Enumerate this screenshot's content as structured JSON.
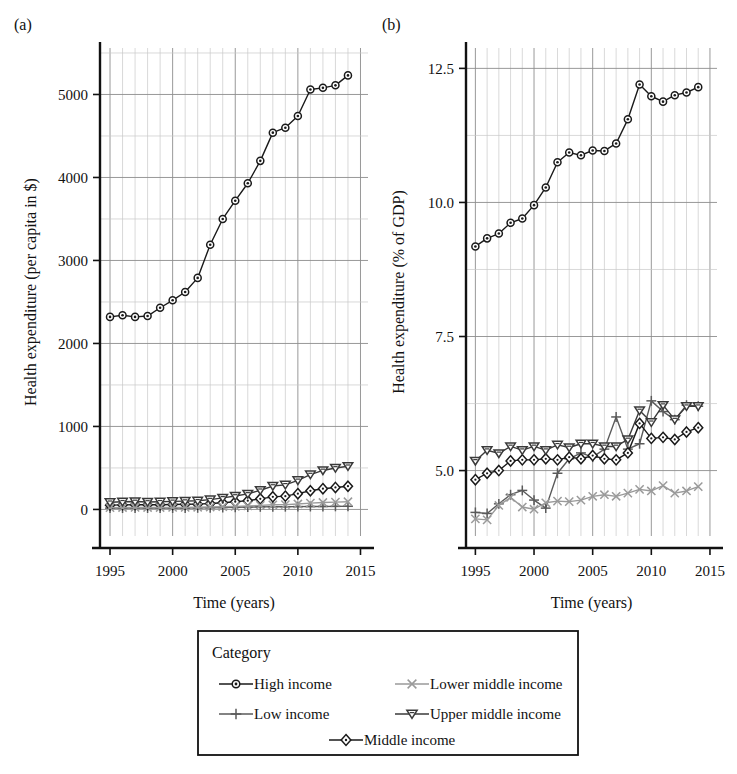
{
  "figure": {
    "panel_a_label": "(a)",
    "panel_b_label": "(b)",
    "xlabel": "Time (years)"
  },
  "legend": {
    "title": "Category",
    "box": true,
    "entries": [
      {
        "label": "High income",
        "marker": "circle",
        "color": "#1a1a1a"
      },
      {
        "label": "Lower middle income",
        "marker": "x",
        "color": "#9a9a9a"
      },
      {
        "label": "Low income",
        "marker": "plus",
        "color": "#5a5a5a"
      },
      {
        "label": "Upper middle income",
        "marker": "triangle-down",
        "color": "#3a3a3a"
      },
      {
        "label": "Middle income",
        "marker": "diamond",
        "color": "#1a1a1a"
      }
    ]
  },
  "chart_data": [
    {
      "type": "line",
      "panel": "(a)",
      "title": "",
      "xlabel": "Time (years)",
      "ylabel": "Health expenditure (per capita in $)",
      "xlim": [
        1994.2,
        2015.6
      ],
      "ylim": [
        -320,
        5560
      ],
      "xticks": [
        1995,
        2000,
        2005,
        2010,
        2015
      ],
      "yticks": [
        0,
        1000,
        2000,
        3000,
        4000,
        5000
      ],
      "xtick_labels": [
        "1995",
        "2000",
        "2005",
        "2010",
        "2015"
      ],
      "ytick_labels": [
        "0",
        "1000",
        "2000",
        "3000",
        "4000",
        "5000"
      ],
      "grid": true,
      "legend_position": "below-figure",
      "x": [
        1995,
        1996,
        1997,
        1998,
        1999,
        2000,
        2001,
        2002,
        2003,
        2004,
        2005,
        2006,
        2007,
        2008,
        2009,
        2010,
        2011,
        2012,
        2013,
        2014
      ],
      "series": [
        {
          "name": "High income",
          "marker": "circle",
          "color": "#1a1a1a",
          "values": [
            2320,
            2340,
            2320,
            2330,
            2430,
            2520,
            2620,
            2790,
            3190,
            3500,
            3720,
            3930,
            4200,
            4540,
            4600,
            4740,
            5060,
            5080,
            5110,
            5230
          ]
        },
        {
          "name": "Low income",
          "marker": "plus",
          "color": "#5a5a5a",
          "values": [
            16,
            16,
            17,
            17,
            17,
            17,
            18,
            19,
            21,
            23,
            26,
            28,
            31,
            33,
            33,
            34,
            35,
            36,
            37,
            38
          ]
        },
        {
          "name": "Middle income",
          "marker": "diamond",
          "color": "#1a1a1a",
          "values": [
            52,
            55,
            58,
            56,
            57,
            60,
            62,
            64,
            71,
            81,
            93,
            106,
            128,
            152,
            160,
            190,
            225,
            250,
            265,
            280
          ]
        },
        {
          "name": "Lower middle income",
          "marker": "x",
          "color": "#9a9a9a",
          "values": [
            22,
            23,
            24,
            23,
            23,
            24,
            25,
            26,
            29,
            33,
            37,
            42,
            49,
            56,
            58,
            66,
            76,
            84,
            88,
            93
          ]
        },
        {
          "name": "Upper middle income",
          "marker": "triangle-down",
          "color": "#3a3a3a",
          "values": [
            86,
            92,
            96,
            90,
            92,
            97,
            100,
            104,
            118,
            139,
            162,
            187,
            231,
            282,
            296,
            350,
            420,
            470,
            500,
            520
          ]
        }
      ]
    },
    {
      "type": "line",
      "panel": "(b)",
      "title": "",
      "xlabel": "Time (years)",
      "ylabel": "Health expenditure (% of GDP)",
      "xlim": [
        1994.2,
        2015.6
      ],
      "ylim": [
        3.78,
        12.88
      ],
      "xticks": [
        1995,
        2000,
        2005,
        2010,
        2015
      ],
      "yticks": [
        5.0,
        7.5,
        10.0,
        12.5
      ],
      "xtick_labels": [
        "1995",
        "2000",
        "2005",
        "2010",
        "2015"
      ],
      "ytick_labels": [
        "5.0",
        "7.5",
        "10.0",
        "12.5"
      ],
      "grid": true,
      "legend_position": "below-figure",
      "x": [
        1995,
        1996,
        1997,
        1998,
        1999,
        2000,
        2001,
        2002,
        2003,
        2004,
        2005,
        2006,
        2007,
        2008,
        2009,
        2010,
        2011,
        2012,
        2013,
        2014
      ],
      "series": [
        {
          "name": "High income",
          "marker": "circle",
          "color": "#1a1a1a",
          "values": [
            9.18,
            9.33,
            9.42,
            9.62,
            9.7,
            9.95,
            10.28,
            10.75,
            10.93,
            10.88,
            10.97,
            10.96,
            11.1,
            11.55,
            12.2,
            11.98,
            11.88,
            12.0,
            12.05,
            12.15
          ]
        },
        {
          "name": "Low income",
          "marker": "plus",
          "color": "#5a5a5a",
          "values": [
            4.22,
            4.2,
            4.38,
            4.55,
            4.63,
            4.45,
            4.3,
            4.95,
            5.22,
            5.33,
            5.25,
            5.4,
            6.0,
            5.4,
            5.5,
            6.3,
            6.1,
            5.95,
            6.22,
            6.2
          ]
        },
        {
          "name": "Middle income",
          "marker": "diamond",
          "color": "#1a1a1a",
          "values": [
            4.83,
            4.95,
            5.0,
            5.18,
            5.2,
            5.2,
            5.22,
            5.2,
            5.25,
            5.22,
            5.28,
            5.22,
            5.2,
            5.33,
            5.88,
            5.6,
            5.62,
            5.58,
            5.72,
            5.8
          ]
        },
        {
          "name": "Lower middle income",
          "marker": "x",
          "color": "#9a9a9a",
          "values": [
            4.1,
            4.08,
            4.35,
            4.5,
            4.32,
            4.28,
            4.4,
            4.43,
            4.42,
            4.45,
            4.52,
            4.55,
            4.52,
            4.58,
            4.65,
            4.62,
            4.72,
            4.58,
            4.62,
            4.7
          ]
        },
        {
          "name": "Upper middle income",
          "marker": "triangle-down",
          "color": "#3a3a3a",
          "values": [
            5.18,
            5.38,
            5.32,
            5.45,
            5.38,
            5.45,
            5.38,
            5.48,
            5.43,
            5.5,
            5.5,
            5.45,
            5.45,
            5.58,
            6.12,
            5.9,
            6.22,
            5.95,
            6.2,
            6.2
          ]
        }
      ]
    }
  ]
}
